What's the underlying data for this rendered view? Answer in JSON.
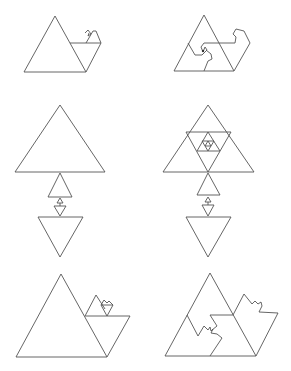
{
  "figure": {
    "stroke_color": "#555555",
    "background": "#ffffff",
    "panels": [
      {
        "id": "top-left",
        "label": "triangle with attached parallelogram and small recursive hooks"
      },
      {
        "id": "top-right",
        "label": "triangle with spiral hook subdivision"
      },
      {
        "id": "middle-left",
        "label": "stacked triangles shrinking to a point then inverted triangles"
      },
      {
        "id": "middle-right",
        "label": "subdivided triangle with nested inner triangles and stacked column"
      },
      {
        "id": "bottom-left",
        "label": "triangle with parallelogram and recursive small triangles"
      },
      {
        "id": "bottom-right",
        "label": "triangle tiled with jagged self-similar pieces"
      }
    ]
  }
}
